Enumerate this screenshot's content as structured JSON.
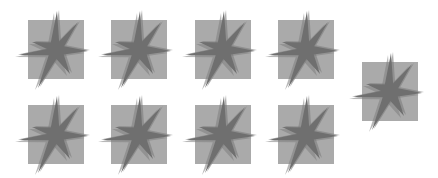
{
  "colors": {
    "background": "#ffffff",
    "square": "#aaaaaa",
    "star": "#6f6f6f",
    "star_shadow": "#7d7d7d"
  },
  "tiles": [
    {
      "name": "tile-row1-col1",
      "icon": "seven-point-star-icon"
    },
    {
      "name": "tile-row1-col2",
      "icon": "seven-point-star-icon"
    },
    {
      "name": "tile-row1-col3",
      "icon": "seven-point-star-icon"
    },
    {
      "name": "tile-row1-col4",
      "icon": "seven-point-star-icon"
    },
    {
      "name": "tile-row2-col1",
      "icon": "seven-point-star-icon"
    },
    {
      "name": "tile-row2-col2",
      "icon": "seven-point-star-icon"
    },
    {
      "name": "tile-row2-col3",
      "icon": "seven-point-star-icon"
    },
    {
      "name": "tile-row2-col4",
      "icon": "seven-point-star-icon"
    },
    {
      "name": "tile-right",
      "icon": "seven-point-star-icon"
    }
  ]
}
